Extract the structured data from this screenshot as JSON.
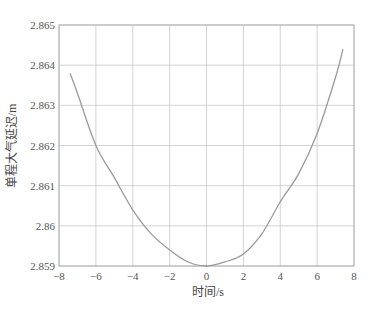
{
  "chart_data": {
    "type": "line",
    "title": "",
    "xlabel": "时间/s",
    "ylabel": "单程大气延迟/m",
    "xlim": [
      -8,
      8
    ],
    "ylim": [
      2.859,
      2.865
    ],
    "xticks": [
      -8,
      -6,
      -4,
      -2,
      0,
      2,
      4,
      6,
      8
    ],
    "xtick_labels": [
      "−8",
      "−6",
      "−4",
      "−2",
      "0",
      "2",
      "4",
      "6",
      "8"
    ],
    "yticks": [
      2.859,
      2.86,
      2.861,
      2.862,
      2.863,
      2.864,
      2.865
    ],
    "ytick_labels": [
      "2.859",
      "2.86",
      "2.861",
      "2.862",
      "2.863",
      "2.864",
      "2.865"
    ],
    "grid": true,
    "legend": null,
    "series": [
      {
        "name": "单程大气延迟",
        "color": "#9a9a9a",
        "x": [
          -7.4,
          -7,
          -6,
          -5,
          -4,
          -3,
          -2,
          -1,
          0,
          1,
          2,
          3,
          4,
          5,
          6,
          7,
          7.4
        ],
        "y": [
          2.8638,
          2.8633,
          2.862,
          2.8612,
          2.8604,
          2.8598,
          2.8594,
          2.8591,
          2.859,
          2.8591,
          2.8593,
          2.8598,
          2.8606,
          2.8613,
          2.8623,
          2.8637,
          2.8644
        ]
      }
    ]
  },
  "colors": {
    "grid": "#c8c8c8",
    "axis": "#b0b0b0",
    "curve": "#9a9a9a",
    "text": "#555555"
  }
}
